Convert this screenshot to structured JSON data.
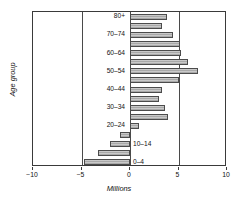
{
  "chart_data": {
    "type": "bar",
    "orientation": "horizontal",
    "title": "",
    "xlabel": "Millions",
    "ylabel": "Age group",
    "xlim": [
      -10,
      10
    ],
    "xticks": [
      -10,
      -5,
      0,
      5,
      10
    ],
    "xticklabels": [
      "-10",
      "-5",
      "0",
      "5",
      "10"
    ],
    "grid": false,
    "gridlines_x": [
      -5,
      0,
      5
    ],
    "legend": null,
    "bar_color": "#c9c9c9",
    "bar_edge_color": "#4c4c4c",
    "categories": [
      "0-4",
      "5-9",
      "10-14",
      "15-19",
      "20-24",
      "25-29",
      "30-34",
      "35-39",
      "40-44",
      "45-49",
      "50-54",
      "55-59",
      "60-64",
      "65-69",
      "70-74",
      "75-79",
      "80+"
    ],
    "values": [
      -4.7,
      -3.3,
      -2.1,
      -1.0,
      0.9,
      3.9,
      3.6,
      3.0,
      3.3,
      5.0,
      7.0,
      6.0,
      5.3,
      5.2,
      4.4,
      3.3,
      3.8
    ],
    "visible_category_labels": [
      "0-4",
      "10-14",
      "20-24",
      "30-34",
      "40-44",
      "50-54",
      "60-64",
      "70-74",
      "80+"
    ]
  }
}
